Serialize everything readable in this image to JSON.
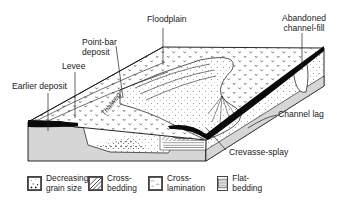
{
  "diagram": {
    "colors": {
      "surface": "#ffffff",
      "section_grey": "#d6d6d6",
      "outline": "#111111",
      "channel_fill": "#0a0a0a"
    },
    "labels": {
      "floodplain": "Floodplain",
      "abandoned_line1": "Abandoned",
      "abandoned_line2": "channel-fill",
      "point_bar_line1": "Point-bar",
      "point_bar_line2": "deposit",
      "levee": "Levee",
      "earlier_deposit": "Earlier deposit",
      "thalweg": "Thalweg",
      "channel_lag": "Channel lag",
      "crevasse_splay": "Crevasse-splay"
    }
  },
  "legend": {
    "items": [
      {
        "icon": "dotted-grain-pattern-icon",
        "line1": "Decreasing",
        "line2": "grain size"
      },
      {
        "icon": "diagonal-hatch-pattern-icon",
        "line1": "Cross-",
        "line2": "bedding"
      },
      {
        "icon": "wavy-lamination-pattern-icon",
        "line1": "Cross-",
        "line2": "lamination"
      },
      {
        "icon": "horizontal-lines-pattern-icon",
        "line1": "Flat-bedding",
        "line2": ""
      }
    ]
  }
}
